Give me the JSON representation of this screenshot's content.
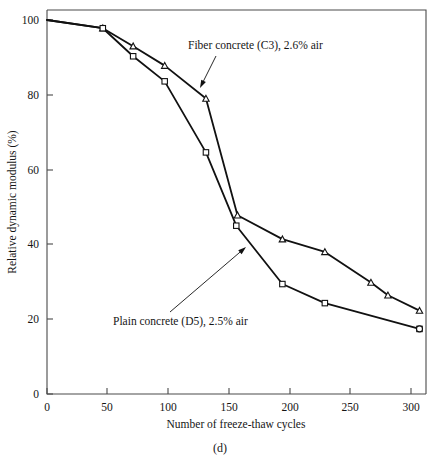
{
  "chart_data": {
    "type": "line",
    "title": "",
    "panel_label": "(d)",
    "xlabel": "Number of freeze-thaw cycles",
    "ylabel": "Relative dynamic modulus (%)",
    "xlim": [
      0,
      312
    ],
    "ylim": [
      0,
      102
    ],
    "grid": false,
    "legend_position": "inline-annotations",
    "xticks": [
      0,
      50,
      100,
      150,
      200,
      250,
      300
    ],
    "xticklabels": [
      "0",
      "50",
      "100",
      "150",
      "200",
      "250",
      "300"
    ],
    "yticks": [
      0,
      20,
      40,
      60,
      80,
      100
    ],
    "yticklabels": [
      "0",
      "20",
      "40",
      "60",
      "80",
      "100"
    ],
    "series": [
      {
        "name": "Fiber concrete (C3), 2.6% air",
        "marker": "triangle",
        "x": [
          0,
          46,
          71,
          97,
          131,
          157,
          194,
          229,
          267,
          281,
          307
        ],
        "y": [
          100,
          97.8,
          93.0,
          87.8,
          79.0,
          47.8,
          41.4,
          38.0,
          29.8,
          26.4,
          22.3
        ]
      },
      {
        "name": "Plain concrete (D5), 2.5% air",
        "marker": "square",
        "x": [
          0,
          46,
          71,
          97,
          131,
          156,
          194,
          229,
          307
        ],
        "y": [
          100,
          97.8,
          90.3,
          83.6,
          64.6,
          45.0,
          29.4,
          24.3,
          17.4
        ]
      }
    ],
    "annotations": [
      {
        "text": "Fiber concrete (C3), 2.6% air",
        "text_x": 188,
        "text_y": 49,
        "arrow_from_x": 216,
        "arrow_from_y": 56,
        "arrow_to_x": 200,
        "arrow_to_y": 88
      },
      {
        "text": "Plain concrete (D5), 2.5% air",
        "text_x": 113,
        "text_y": 325,
        "arrow_from_x": 170,
        "arrow_from_y": 312,
        "arrow_to_x": 246,
        "arrow_to_y": 247
      }
    ]
  }
}
